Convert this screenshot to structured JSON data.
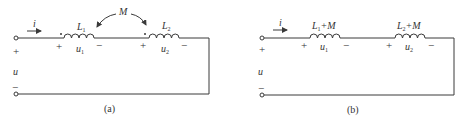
{
  "figure_a": {
    "caption": "(a)",
    "current_label": "i",
    "source_voltage_label": "u",
    "plus": "+",
    "minus": "−",
    "mutual_label": "M",
    "inductor1": {
      "name": "L",
      "sub": "1",
      "voltage": "u",
      "voltage_sub": "1",
      "dot": true
    },
    "inductor2": {
      "name": "L",
      "sub": "2",
      "voltage": "u",
      "voltage_sub": "2",
      "dot": true
    }
  },
  "figure_b": {
    "caption": "(b)",
    "current_label": "i",
    "source_voltage_label": "u",
    "plus": "+",
    "minus": "−",
    "inductor1": {
      "name": "L",
      "sub": "1",
      "suffix": "+M",
      "voltage": "u",
      "voltage_sub": "1"
    },
    "inductor2": {
      "name": "L",
      "sub": "2",
      "suffix": "+M",
      "voltage": "u",
      "voltage_sub": "2"
    }
  },
  "colors": {
    "line": "#3a3a3a",
    "text": "#333333",
    "background": "#ffffff"
  }
}
